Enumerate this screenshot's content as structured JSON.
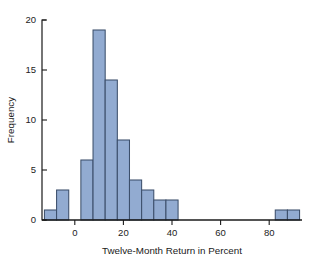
{
  "chart_data": {
    "type": "bar",
    "title": "",
    "subtitle": "",
    "xlabel": "Twelve-Month Return in Percent",
    "ylabel": "Frequency",
    "xlim": [
      -13.5,
      93.5
    ],
    "ylim": [
      0,
      20
    ],
    "grid": false,
    "legend": null,
    "bin_width": 5,
    "bin_edges": [
      -12.5,
      -7.5,
      -2.5,
      2.5,
      7.5,
      12.5,
      17.5,
      22.5,
      27.5,
      32.5,
      37.5,
      42.5,
      47.5,
      52.5,
      57.5,
      62.5,
      67.5,
      72.5,
      77.5,
      82.5,
      87.5,
      92.5
    ],
    "categories": [
      "-12.5 to -7.5",
      "-7.5 to -2.5",
      "-2.5 to 2.5",
      "2.5 to 7.5",
      "7.5 to 12.5",
      "12.5 to 17.5",
      "17.5 to 22.5",
      "22.5 to 27.5",
      "27.5 to 32.5",
      "32.5 to 37.5",
      "37.5 to 42.5",
      "42.5 to 47.5",
      "47.5 to 52.5",
      "52.5 to 57.5",
      "57.5 to 62.5",
      "62.5 to 67.5",
      "67.5 to 72.5",
      "72.5 to 77.5",
      "77.5 to 82.5",
      "82.5 to 87.5",
      "87.5 to 92.5"
    ],
    "values": [
      1,
      3,
      0,
      6,
      19,
      14,
      8,
      4,
      3,
      2,
      2,
      0,
      0,
      0,
      0,
      0,
      0,
      0,
      0,
      1,
      1
    ],
    "x_ticks": [
      0,
      20,
      40,
      60,
      80
    ],
    "x_tick_labels": [
      "0",
      "20",
      "40",
      "60",
      "80"
    ],
    "y_ticks": [
      0,
      5,
      10,
      15,
      20
    ],
    "y_tick_labels": [
      "0",
      "5",
      "10",
      "15",
      "20"
    ],
    "bar_fill_color": "#92abd1",
    "bar_border_color": "#3c4f6b",
    "axis_color": "#1a1a1a",
    "background_color": "#ffffff",
    "total_count": 61
  }
}
